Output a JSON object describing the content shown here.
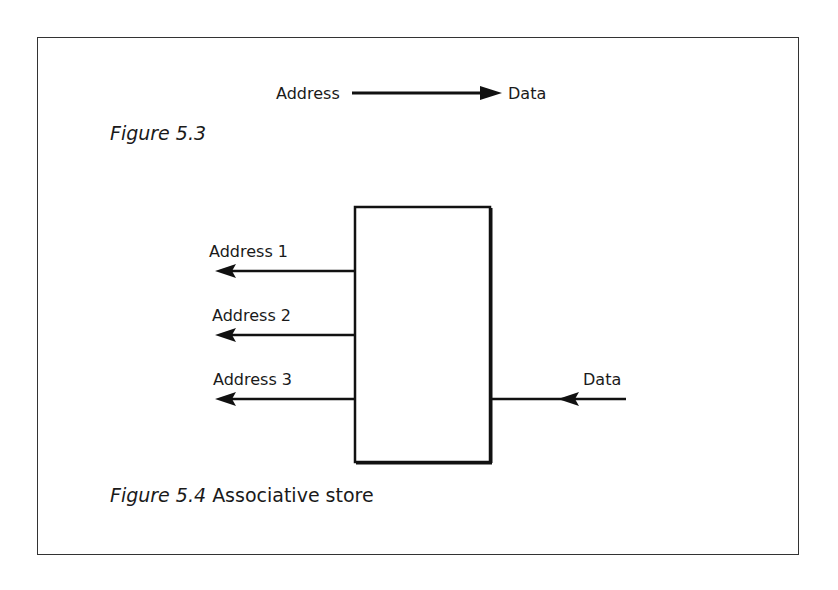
{
  "figure_5_3": {
    "caption_label": "Figure 5.3",
    "source_label": "Address",
    "target_label": "Data"
  },
  "figure_5_4": {
    "caption_label": "Figure 5.4",
    "caption_title": "Associative store",
    "outputs": [
      {
        "label": "Address 1"
      },
      {
        "label": "Address 2"
      },
      {
        "label": "Address 3"
      }
    ],
    "input": {
      "label": "Data"
    }
  }
}
